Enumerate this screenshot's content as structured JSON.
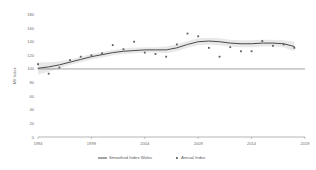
{
  "chart_data": {
    "type": "line",
    "title": "",
    "xlabel": "",
    "ylabel": "MII Index",
    "xlim": [
      1994,
      2019
    ],
    "ylim": [
      0,
      180
    ],
    "xticks": [
      1994,
      1999,
      2004,
      2009,
      2014,
      2019
    ],
    "yticks": [
      0,
      20,
      40,
      60,
      80,
      100,
      120,
      140,
      160,
      180
    ],
    "grid": false,
    "legend_position": "bottom",
    "reference_line": 100,
    "x": [
      1994,
      1995,
      1996,
      1997,
      1998,
      1999,
      2000,
      2001,
      2002,
      2003,
      2004,
      2005,
      2006,
      2007,
      2008,
      2009,
      2010,
      2011,
      2012,
      2013,
      2014,
      2015,
      2016,
      2017,
      2018
    ],
    "series": [
      {
        "name": "Annual Index",
        "type": "scatter",
        "values": [
          107,
          93,
          102,
          113,
          118,
          120,
          123,
          135,
          129,
          140,
          124,
          122,
          118,
          136,
          152,
          148,
          131,
          118,
          132,
          126,
          126,
          141,
          134,
          136,
          131
        ]
      },
      {
        "name": "Smoothed Index Wales",
        "type": "line",
        "values": [
          101,
          103,
          106,
          110,
          114,
          118,
          121,
          124,
          126,
          127,
          128,
          128,
          128,
          131,
          136,
          140,
          141,
          140,
          138,
          137,
          137,
          138,
          138,
          137,
          133
        ]
      }
    ],
    "confidence_band": {
      "upper": [
        110,
        110,
        111,
        114,
        118,
        122,
        125,
        128,
        130,
        131,
        132,
        132,
        133,
        136,
        141,
        145,
        146,
        145,
        143,
        142,
        142,
        143,
        143,
        142,
        140
      ],
      "lower": [
        92,
        96,
        101,
        106,
        110,
        114,
        117,
        120,
        122,
        123,
        124,
        124,
        123,
        126,
        131,
        135,
        136,
        135,
        133,
        132,
        132,
        133,
        133,
        132,
        126
      ]
    },
    "legend": [
      {
        "label": "Smoothed Index Wales",
        "marker": "line",
        "color": "#4a4a4a"
      },
      {
        "label": "Annual Index",
        "marker": "point",
        "color": "#5d5d5d"
      }
    ]
  }
}
